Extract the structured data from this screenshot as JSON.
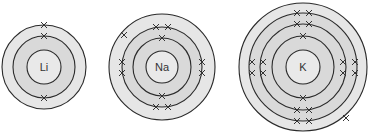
{
  "colors": {
    "background": "#ffffff",
    "stroke": "#2a2a2a",
    "outer_fill": "#e6e6e6",
    "shell_fill": "#d9d9d9",
    "nucleus_fill": "#e9e9e9",
    "electron": "#333333"
  },
  "atoms": [
    {
      "symbol": "Li",
      "cx": 44,
      "cy": 67,
      "nucleus_r": 17,
      "shells": [
        {
          "r": 31,
          "electrons": 2,
          "marks": [
            [
              44,
              36
            ],
            [
              44,
              98
            ]
          ]
        },
        {
          "r": 42,
          "electrons": 1,
          "marks": [
            [
              44,
              25
            ]
          ]
        }
      ]
    },
    {
      "symbol": "Na",
      "cx": 162,
      "cy": 67,
      "nucleus_r": 16,
      "shells": [
        {
          "r": 29,
          "electrons": 2,
          "marks": [
            [
              162,
              38
            ],
            [
              162,
              96
            ]
          ]
        },
        {
          "r": 40,
          "electrons": 8,
          "marks": [
            [
              156,
              27
            ],
            [
              168,
              27
            ],
            [
              156,
              107
            ],
            [
              168,
              107
            ],
            [
              122,
              62
            ],
            [
              122,
              73
            ],
            [
              202,
              62
            ],
            [
              202,
              73
            ]
          ]
        },
        {
          "r": 53,
          "electrons": 1,
          "marks": [
            [
              124,
              35
            ]
          ]
        }
      ]
    },
    {
      "symbol": "K",
      "cx": 303,
      "cy": 67,
      "nucleus_r": 17,
      "shells": [
        {
          "r": 31,
          "electrons": 2,
          "marks": [
            [
              303,
              36
            ],
            [
              303,
              98
            ]
          ]
        },
        {
          "r": 43,
          "electrons": 8,
          "marks": [
            [
              297,
              24
            ],
            [
              309,
              24
            ],
            [
              297,
              110
            ],
            [
              309,
              110
            ],
            [
              263,
              62
            ],
            [
              263,
              73
            ],
            [
              343,
              62
            ],
            [
              343,
              73
            ]
          ]
        },
        {
          "r": 54,
          "electrons": 8,
          "marks": [
            [
              297,
              13
            ],
            [
              309,
              13
            ],
            [
              297,
              121
            ],
            [
              309,
              121
            ],
            [
              252,
              62
            ],
            [
              252,
              73
            ],
            [
              355,
              62
            ],
            [
              355,
              73
            ]
          ]
        },
        {
          "r": 64,
          "electrons": 1,
          "marks": [
            [
              346,
              118
            ]
          ]
        }
      ]
    }
  ]
}
